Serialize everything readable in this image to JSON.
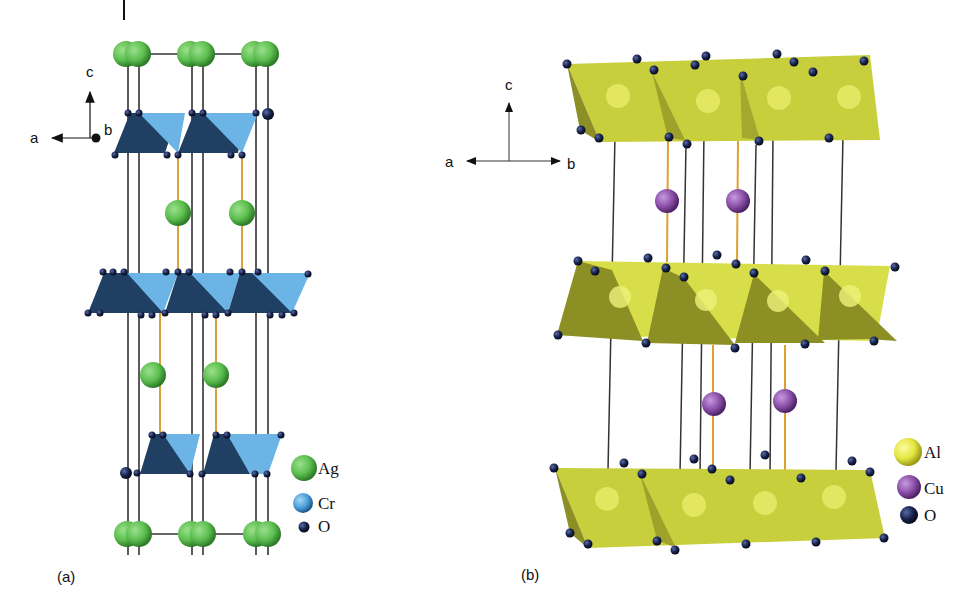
{
  "figure": {
    "panels": [
      {
        "label": "(a)",
        "compound_elements": [
          "Ag",
          "Cr",
          "O"
        ],
        "axes": {
          "vertical": "c",
          "horizontal": "a",
          "out_of_plane": "b"
        },
        "legend": [
          {
            "element": "Ag",
            "color": "#5cbf4f"
          },
          {
            "element": "Cr",
            "color": "#4a9fd8"
          },
          {
            "element": "O",
            "color": "#16224a"
          }
        ],
        "polyhedra_color": "#4a8fc9",
        "polyhedra_dark_color": "#1f3f63",
        "bond_color": "#d9a13a"
      },
      {
        "label": "(b)",
        "compound_elements": [
          "Al",
          "Cu",
          "O"
        ],
        "axes": {
          "vertical": "c",
          "left": "a",
          "right": "b"
        },
        "legend": [
          {
            "element": "Al",
            "color": "#e4e640"
          },
          {
            "element": "Cu",
            "color": "#8a4fa8"
          },
          {
            "element": "O",
            "color": "#16224a"
          }
        ],
        "polyhedra_color": "#c8cf3c",
        "polyhedra_dark_color": "#8b8f24",
        "bond_color": "#e0a030"
      }
    ]
  }
}
